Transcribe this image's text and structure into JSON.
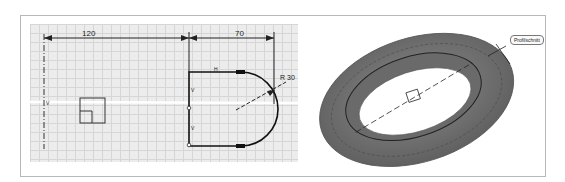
{
  "sketch": {
    "dim_horizontal_1": "120",
    "dim_horizontal_2": "70",
    "dim_radius": "R 30",
    "constraint_h": "H",
    "constraint_v1": "V",
    "constraint_v2": "V",
    "axis_label": "V"
  },
  "view3d": {
    "feature_tag": "Profilschnitt",
    "body_color": "#707070"
  }
}
